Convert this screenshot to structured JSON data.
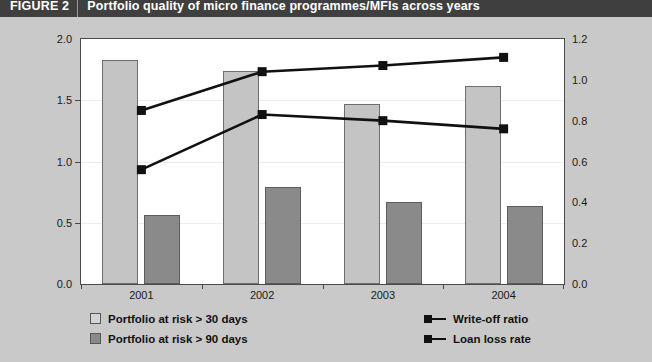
{
  "header": {
    "figure_label": "FIGURE 2",
    "title": "Portfolio quality of micro finance programmes/MFIs across years",
    "bar_color": "#3f3f3f",
    "text_color": "#ffffff"
  },
  "colors": {
    "background": "#c9c9c9",
    "plot_background": "#ffffff",
    "bar_light": "#c4c4c4",
    "bar_dark": "#8a8a8a",
    "line": "#111111",
    "axis": "#4a4a4a"
  },
  "chart_data": {
    "type": "bar",
    "title": "Portfolio quality of micro finance programmes/MFIs across years",
    "xlabel": "",
    "ylabel": "",
    "categories": [
      "2001",
      "2002",
      "2003",
      "2004"
    ],
    "grid": false,
    "legend_position": "bottom",
    "left_axis": {
      "ylim": [
        0.0,
        2.0
      ],
      "ticks": [
        "0.0",
        "0.5",
        "1.0",
        "1.5",
        "2.0"
      ],
      "tick_values": [
        0.0,
        0.5,
        1.0,
        1.5,
        2.0
      ]
    },
    "right_axis": {
      "ylim": [
        0.0,
        1.2
      ],
      "ticks": [
        "0.0",
        "0.2",
        "0.4",
        "0.6",
        "0.8",
        "1.0",
        "1.2"
      ],
      "tick_values": [
        0.0,
        0.2,
        0.4,
        0.6,
        0.8,
        1.0,
        1.2
      ]
    },
    "series": [
      {
        "name": "Portfolio at risk > 30 days",
        "type": "bar",
        "axis": "left",
        "color": "#c4c4c4",
        "values": [
          1.83,
          1.74,
          1.47,
          1.62
        ]
      },
      {
        "name": "Portfolio at risk > 90 days",
        "type": "bar",
        "axis": "left",
        "color": "#8a8a8a",
        "values": [
          0.56,
          0.79,
          0.67,
          0.64
        ]
      },
      {
        "name": "Write-off ratio",
        "type": "line",
        "axis": "right",
        "color": "#111111",
        "values": [
          0.85,
          1.04,
          1.07,
          1.11
        ]
      },
      {
        "name": "Loan loss rate",
        "type": "line",
        "axis": "right",
        "color": "#111111",
        "values": [
          0.56,
          0.83,
          0.8,
          0.76
        ]
      }
    ]
  },
  "legend": {
    "left_items": [
      {
        "label": "Portfolio at risk > 30 days",
        "marker": "square-light"
      },
      {
        "label": "Portfolio at risk > 90 days",
        "marker": "square-dark"
      }
    ],
    "right_items": [
      {
        "label": "Write-off ratio",
        "marker": "line-square"
      },
      {
        "label": "Loan loss rate",
        "marker": "line-square"
      }
    ]
  }
}
